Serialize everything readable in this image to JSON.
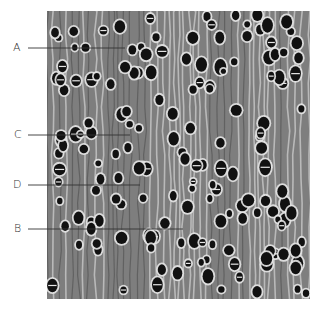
{
  "figure": {
    "photo": {
      "x": 47,
      "y": 11,
      "width": 263,
      "height": 288,
      "background": "#7e7e7e"
    },
    "labels": [
      {
        "text": "A",
        "label_x": 13,
        "y": 48,
        "line_start": 28,
        "line_end": 125
      },
      {
        "text": "C",
        "label_x": 14,
        "y": 135,
        "line_start": 28,
        "line_end": 130
      },
      {
        "text": "D",
        "label_x": 13,
        "y": 185,
        "line_start": 28,
        "line_end": 140
      },
      {
        "text": "B",
        "label_x": 14,
        "y": 229,
        "line_start": 28,
        "line_end": 183
      }
    ],
    "colors": {
      "line": "#333333",
      "pore": "#111111",
      "halo": "#e6e6e6",
      "ray_light": "#c8c8c8",
      "ray_dark": "#5a5a5a"
    }
  }
}
